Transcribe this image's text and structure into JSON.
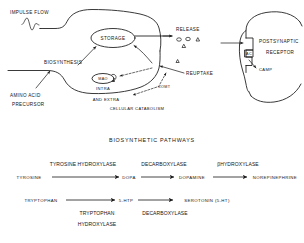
{
  "figure": {
    "name": "neurotransmitter-synapse-diagram",
    "ink_color": "#161616",
    "background_color": "#ffffff"
  },
  "presynaptic": {
    "impulse_flow_label": "IMPULSE FLOW",
    "storage_label": "STORAGE",
    "biosynthesis_label": "BIOSYNTHESIS",
    "mao_label": "MAO",
    "intra_label": "INTRA",
    "and_extra_label": "AND EXTRA",
    "cellular_catabolism_label": "CELLULAR CATABOLISM",
    "amino_acid_label": "AMINO ACID",
    "precursor_label": "PRECURSOR",
    "release_label": "RELEASE",
    "reuptake_label": "REUPTAKE",
    "comt_label": "COMT"
  },
  "postsynaptic": {
    "receptor_label_line1": "POSTSYNAPTIC",
    "receptor_label_line2": "RECEPTOR",
    "ac_label": "AC",
    "camp_label": "CAMP"
  },
  "pathways": {
    "title": "BIOSYNTHETIC PATHWAYS",
    "catecholamine": {
      "enzymes": [
        "TYROSINE HYDROXYLASE",
        "DECARBOXYLASE",
        "βHYDROXYLASE"
      ],
      "compounds": [
        "TYROSINE",
        "DOPA",
        "DOPAMINE",
        "NOREPINEPHRINE"
      ]
    },
    "indolamine": {
      "compounds": [
        "TRYPTOPHAN",
        "5-HTP",
        "SEROTONIN (5-HT)"
      ],
      "enzyme_1_line1": "TRYPTOPHAN",
      "enzyme_1_line2": "HYDROXYLASE",
      "enzyme_2": "DECARBOXYLASE"
    }
  }
}
